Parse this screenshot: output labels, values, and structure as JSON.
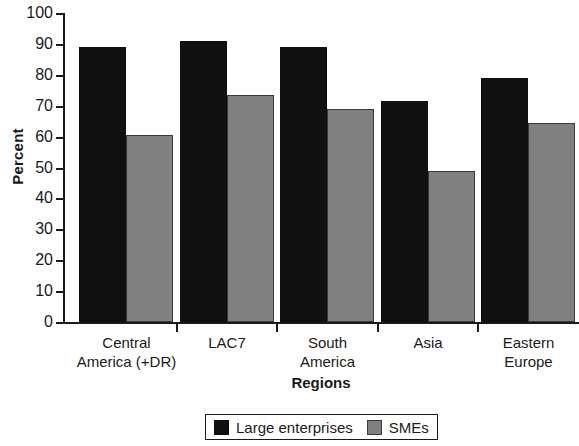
{
  "chart_data": {
    "type": "bar",
    "title": "",
    "xlabel": "Regions",
    "ylabel": "Percent",
    "categories": [
      "Central\nAmerica (+DR)",
      "LAC7",
      "South\nAmerica",
      "Asia",
      "Eastern\nEurope"
    ],
    "series": [
      {
        "name": "Large enterprises",
        "color": "#101010",
        "values": [
          89,
          91,
          89,
          71.5,
          79
        ]
      },
      {
        "name": "SMEs",
        "color": "#808080",
        "values": [
          60.5,
          73.5,
          69,
          49,
          64.5
        ]
      }
    ],
    "ylim": [
      0,
      100
    ],
    "ytick_labels": [
      "100",
      "90",
      "80",
      "70",
      "60",
      "50",
      "40",
      "30",
      "20",
      "10",
      "0"
    ],
    "ytick_values": [
      100,
      90,
      80,
      70,
      60,
      50,
      40,
      30,
      20,
      10,
      0
    ],
    "grid": false,
    "legend_position": "bottom-center"
  },
  "legend": {
    "entries": [
      {
        "label": "Large enterprises",
        "swatch": "black-swatch-icon"
      },
      {
        "label": "SMEs",
        "swatch": "gray-swatch-icon"
      }
    ]
  }
}
